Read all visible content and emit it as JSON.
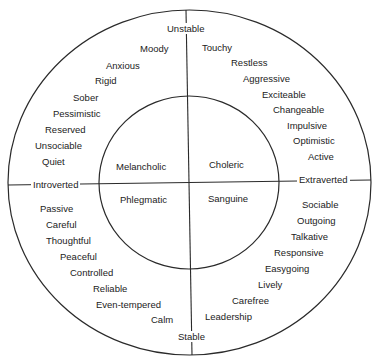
{
  "colors": {
    "line": "#2a2a2a",
    "text": "#222222",
    "background": "#ffffff"
  },
  "axes": {
    "top": "Unstable",
    "bottom": "Stable",
    "left": "Introverted",
    "right": "Extraverted"
  },
  "temperaments": {
    "top_left": "Melancholic",
    "top_right": "Choleric",
    "bottom_left": "Phlegmatic",
    "bottom_right": "Sanguine"
  },
  "traits": {
    "unstable_introverted": [
      "Moody",
      "Anxious",
      "Rigid",
      "Sober",
      "Pessimistic",
      "Reserved",
      "Unsociable",
      "Quiet"
    ],
    "unstable_extraverted": [
      "Touchy",
      "Restless",
      "Aggressive",
      "Exciteable",
      "Changeable",
      "Impulsive",
      "Optimistic",
      "Active"
    ],
    "stable_introverted": [
      "Passive",
      "Careful",
      "Thoughtful",
      "Peaceful",
      "Controlled",
      "Reliable",
      "Even-tempered",
      "Calm"
    ],
    "stable_extraverted": [
      "Sociable",
      "Outgoing",
      "Talkative",
      "Responsive",
      "Easygoing",
      "Lively",
      "Carefree",
      "Leadership"
    ]
  }
}
